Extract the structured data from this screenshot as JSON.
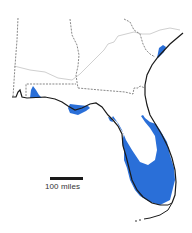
{
  "map": {
    "region": "Florida and surrounding states",
    "scale": {
      "label": "100 miles"
    },
    "colors": {
      "highlight_fill": "#2a6fd8",
      "coastline": "#1a1a1a",
      "state_border": "#555555",
      "river": "#c8c8c8",
      "background": "#ffffff"
    },
    "legend": []
  }
}
